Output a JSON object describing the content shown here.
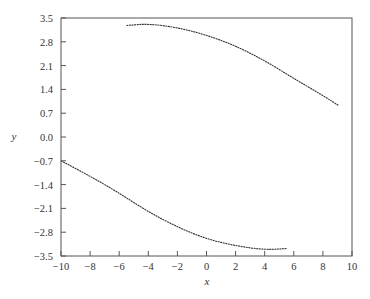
{
  "chart_data": {
    "type": "scatter",
    "title": "",
    "xlabel": "x",
    "ylabel": "y",
    "xlim": [
      -10,
      10
    ],
    "ylim": [
      -3.5,
      3.5
    ],
    "grid": false,
    "legend": null,
    "x_ticks": [
      -10,
      -8,
      -6,
      -4,
      -2,
      0,
      2,
      4,
      6,
      8,
      10
    ],
    "x_tick_labels": [
      "−10",
      "−8",
      "−6",
      "−4",
      "−2",
      "0",
      "2",
      "4",
      "6",
      "8",
      "10"
    ],
    "y_ticks": [
      3.5,
      2.8,
      2.1,
      1.4,
      0.7,
      0.0,
      -0.7,
      -1.4,
      -2.1,
      -2.8,
      -3.5
    ],
    "y_tick_labels": [
      "3.5",
      "2.8",
      "2.1",
      "1.4",
      "0.7",
      "0.0",
      "−0.7",
      "−1.4",
      "−2.1",
      "−2.8",
      "−3.5"
    ],
    "series": [
      {
        "name": "upper branch",
        "x": [
          -5.5,
          -4,
          -2,
          0,
          2,
          4,
          6,
          8,
          9.1
        ],
        "y": [
          3.28,
          3.33,
          3.22,
          3.0,
          2.68,
          2.25,
          1.72,
          1.22,
          0.92
        ]
      },
      {
        "name": "lower branch",
        "x": [
          -10,
          -8,
          -6,
          -4,
          -2,
          0,
          2,
          4,
          5.5
        ],
        "y": [
          -0.7,
          -1.15,
          -1.65,
          -2.2,
          -2.65,
          -3.0,
          -3.2,
          -3.32,
          -3.28
        ]
      }
    ]
  }
}
